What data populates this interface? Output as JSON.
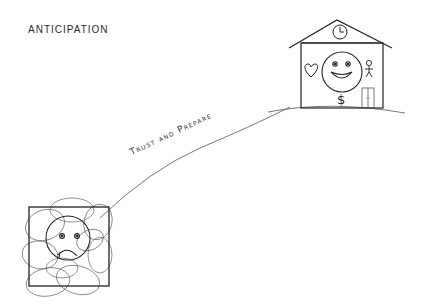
{
  "title": "ANTICIPATION",
  "path": {
    "label": "Trust and Prepare"
  },
  "start": {
    "description": "Anxious, chaotic state: sad face inside a box surrounded by scribbled loops"
  },
  "destination": {
    "description": "House on a hill with clock, smiling face, heart, stick figure, dollar sign and door",
    "elements": [
      "clock-icon",
      "smiley-face-icon",
      "heart-icon",
      "person-icon",
      "dollar-sign-icon",
      "door-icon"
    ],
    "dollar_symbol": "$"
  },
  "colors": {
    "ink": "#222222",
    "line": "#555555",
    "background": "#ffffff"
  }
}
